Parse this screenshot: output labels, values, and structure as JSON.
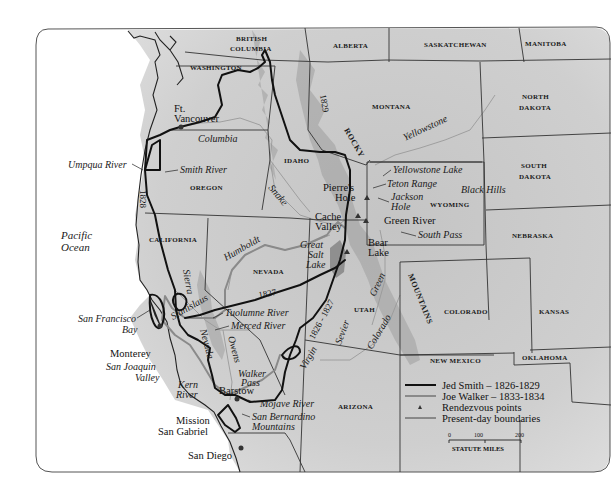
{
  "map": {
    "title": "Jed Smith and Joe Walker routes, 1826-1834",
    "colors": {
      "land": "#c9c9c9",
      "water": "#ffffff",
      "smith_route": "#111111",
      "walker_route": "#8a8a8a",
      "boundary": "#333333",
      "frame": "#555555"
    },
    "regions": {
      "british_columbia": [
        "BRITISH",
        "COLUMBIA"
      ],
      "alberta": "ALBERTA",
      "saskatchewan": "SASKATCHEWAN",
      "manitoba": "MANITOBA",
      "washington": "WASHINGTON",
      "montana": "MONTANA",
      "north_dakota": [
        "NORTH",
        "DAKOTA"
      ],
      "south_dakota": [
        "SOUTH",
        "DAKOTA"
      ],
      "idaho": "IDAHO",
      "oregon": "OREGON",
      "wyoming": "WYOMING",
      "nebraska": "NEBRASKA",
      "california": "CALIFORNIA",
      "nevada": "NEVADA",
      "utah": "UTAH",
      "colorado": "COLORADO",
      "kansas": "KANSAS",
      "new_mexico": "NEW MEXICO",
      "oklahoma": "OKLAHOMA",
      "arizona": "ARIZONA"
    },
    "ocean": [
      "Pacific",
      "Ocean"
    ],
    "places": {
      "ft_vancouver": [
        "Ft.",
        "Vancouver"
      ],
      "pierres_hole": [
        "Pierre's",
        "Hole"
      ],
      "cache_valley": [
        "Cache",
        "Valley"
      ],
      "green_river": "Green River",
      "bear_lake": [
        "Bear",
        "Lake"
      ],
      "monterey": "Monterey",
      "barstow": "Barstow",
      "mission_san_gabriel": [
        "Mission",
        "San Gabriel"
      ],
      "san_diego": "San Diego"
    },
    "features": {
      "umpqua_river": "Umpqua River",
      "smith_river": "Smith River",
      "columbia": "Columbia",
      "snake": "Snake",
      "yellowstone": "Yellowstone",
      "yellowstone_lake": "Yellowstone Lake",
      "teton_range": "Teton Range",
      "jackson_hole": [
        "Jackson",
        "Hole"
      ],
      "black_hills": "Black Hills",
      "south_pass": "South Pass",
      "humboldt": "Humboldt",
      "great_salt_lake": [
        "Great",
        "Salt",
        "Lake"
      ],
      "sierra": "Sierra",
      "nevada_range": "Nevada",
      "stanislaus": "Stanislaus",
      "tuolumne_river": "Tuolumne River",
      "merced_river": "Merced River",
      "owens": "Owens",
      "san_francisco_bay": [
        "San Francisco",
        "Bay"
      ],
      "san_joaquin_valley": [
        "San Joaquin",
        "Valley"
      ],
      "kern_river": [
        "Kern",
        "River"
      ],
      "walker_pass": [
        "Walker",
        "Pass"
      ],
      "mojave_river": "Mojave River",
      "san_bernardino_mountains": [
        "San Bernardino",
        "Mountains"
      ],
      "green": "Green",
      "colorado_river": "Colorado",
      "sevier": "Sevier",
      "virgin": "Virgin",
      "rocky": "ROCKY",
      "mountains": "MOUNTAINS"
    },
    "route_years": {
      "y1828": "1828",
      "y1829": "1829",
      "y1827": "1827",
      "y1826_1827": "1826 - 1827"
    },
    "legend": {
      "items": [
        {
          "label": "Jed Smith – 1826-1829",
          "symbol": "thick-black-line"
        },
        {
          "label": "Joe Walker – 1833-1834",
          "symbol": "thick-gray-line"
        },
        {
          "label": "Rendezvous points",
          "symbol": "triangle"
        },
        {
          "label": "Present-day boundaries",
          "symbol": "thin-line"
        }
      ],
      "scale": {
        "ticks": [
          "0",
          "100",
          "200"
        ],
        "label": "STATUTE MILES"
      }
    }
  }
}
